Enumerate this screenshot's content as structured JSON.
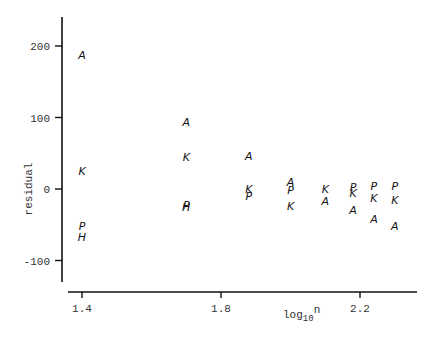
{
  "chart_data": {
    "type": "scatter",
    "title": "",
    "xlabel": "log10 n",
    "xlabel_parts": {
      "base": "log",
      "sub": "10",
      "sup": "n"
    },
    "ylabel": "residual",
    "xlim": [
      1.36,
      2.37
    ],
    "ylim": [
      -130,
      240
    ],
    "xticks": [
      1.4,
      1.8,
      2.2
    ],
    "xtick_labels": [
      "1.4",
      "1.8",
      "2.2"
    ],
    "yticks": [
      -100,
      0,
      100,
      200
    ],
    "ytick_labels": [
      "-100",
      "0",
      "100",
      "200"
    ],
    "grid": false,
    "legend": null,
    "marker_type": "letter",
    "series": [
      {
        "name": "A",
        "x": [
          1.4,
          1.7,
          1.88,
          2.0,
          2.1,
          2.18,
          2.24,
          2.3
        ],
        "y": [
          187,
          94,
          46,
          10,
          -17,
          -29,
          -42,
          -52
        ]
      },
      {
        "name": "K",
        "x": [
          1.4,
          1.7,
          1.88,
          2.0,
          2.1,
          2.18,
          2.24,
          2.3
        ],
        "y": [
          25,
          45,
          0,
          -24,
          0,
          -6,
          -13,
          -15
        ]
      },
      {
        "name": "P",
        "x": [
          1.4,
          1.7,
          1.88,
          2.0,
          2.18,
          2.24,
          2.3
        ],
        "y": [
          -52,
          -22,
          -10,
          -1,
          3,
          4,
          4
        ]
      },
      {
        "name": "H",
        "x": [
          1.4,
          1.7
        ],
        "y": [
          -67,
          -25
        ]
      }
    ]
  },
  "labels": {
    "y_axis": "residual",
    "x_axis_base": "log",
    "x_axis_sub": "10",
    "x_axis_sup": "n"
  }
}
